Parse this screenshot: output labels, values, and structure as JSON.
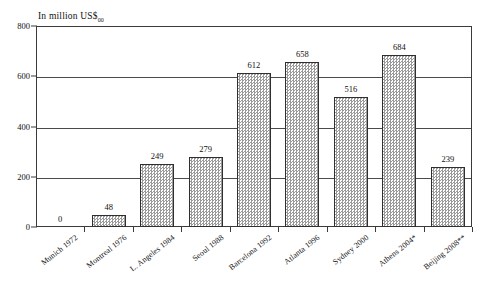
{
  "chart_data": {
    "type": "bar",
    "title": "",
    "subtitle": "",
    "ylabel": "In million US$",
    "ylabel_sub": "00",
    "xlabel": "",
    "ylim": [
      0,
      800
    ],
    "yticks": [
      0,
      200,
      400,
      600,
      800
    ],
    "grid": true,
    "legend": "none",
    "categories": [
      "Munich 1972",
      "Montreal 1976",
      "L. Angeles 1984",
      "Seoul 1988",
      "Barcelona 1992",
      "Atlanta 1996",
      "Sydney 2000",
      "Athens 2004*",
      "Beijing 2008**"
    ],
    "values": [
      0,
      48,
      249,
      279,
      612,
      658,
      516,
      684,
      239
    ],
    "value_labels": [
      "0",
      "48",
      "249",
      "279",
      "612",
      "658",
      "516",
      "684",
      "239"
    ]
  }
}
